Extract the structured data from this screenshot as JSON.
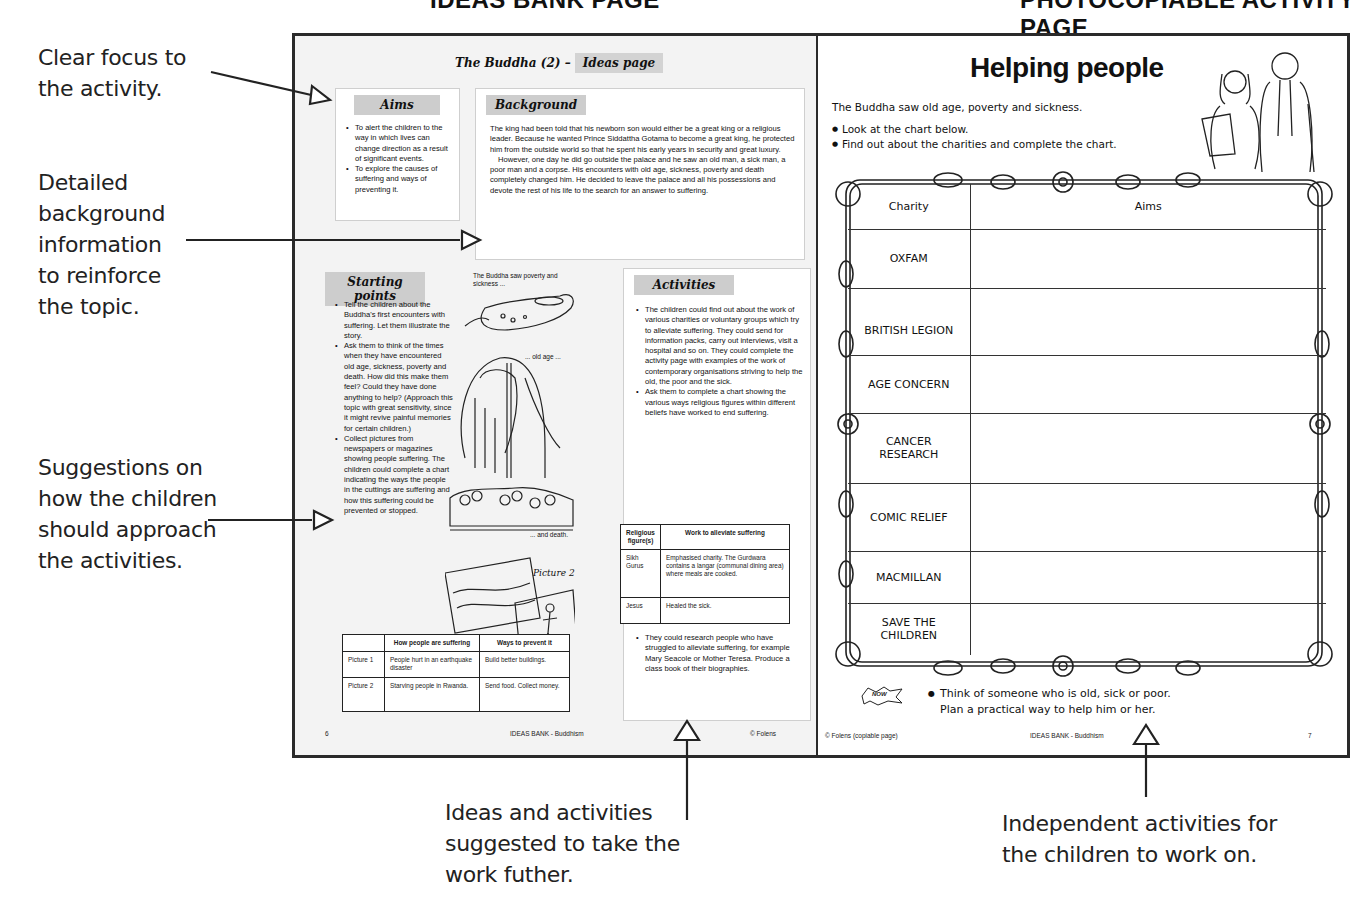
{
  "headings": {
    "left": "IDEAS BANK PAGE",
    "right": "PHOTOCOPIABLE ACTIVITY PAGE"
  },
  "annotations": {
    "clear_focus": [
      "Clear focus to",
      "the activity."
    ],
    "background_info": [
      "Detailed",
      "background",
      "information",
      "to reinforce",
      "the topic."
    ],
    "suggestions": [
      "Suggestions on",
      "how the children",
      "should approach",
      "the activities."
    ],
    "ideas_further": [
      "Ideas and activities",
      "suggested to take the",
      "work futher."
    ],
    "independent": [
      "Independent activities for",
      "the children to work on."
    ]
  },
  "ideas_page": {
    "title": "The Buddha (2) –",
    "title_tag": "Ideas page",
    "aims": {
      "heading": "Aims",
      "items": [
        "To alert the children to the way in which lives can change direction as a result of significant events.",
        "To explore the causes of suffering and ways of preventing it."
      ]
    },
    "background": {
      "heading": "Background",
      "paragraphs": [
        "The king had been told that his newborn son would either be a great king or a religious leader. Because he wanted Prince Siddattha Gotama to become a great king, he protected him from the outside world so that he spent his early years in security and great luxury.",
        "However, one day he did go outside the palace and he saw an old man, a sick man, a poor man and a corpse. His encounters with old age, sickness, poverty and death completely changed him. He decided to leave the palace and all his possessions and devote the rest of his life to the search for an answer to suffering."
      ]
    },
    "starting_points": {
      "heading": "Starting points",
      "items": [
        "Tell the children about the Buddha's first encounters with suffering. Let them illustrate the story.",
        "Ask them to think of the times when they have encountered old age, sickness, poverty and death. How did this make them feel? Could they have done anything to help? (Approach this topic with great sensitivity, since it might revive painful memories for certain children.)",
        "Collect pictures from newspapers or magazines showing people suffering. The children could complete a chart indicating the ways the people in the cuttings are suffering and how this suffering could be prevented or stopped."
      ]
    },
    "illustration_captions": {
      "poverty": "The Buddha saw poverty and sickness ...",
      "old_age": "... old age ...",
      "death": "... and death.",
      "picture1": "Picture 1",
      "picture2": "Picture 2"
    },
    "suffering_table": {
      "headers": [
        "",
        "How people are suffering",
        "Ways to prevent it"
      ],
      "rows": [
        [
          "Picture 1",
          "People hurt in an earthquake disaster",
          "Build better buildings."
        ],
        [
          "Picture 2",
          "Starving people in Rwanda.",
          "Send food. Collect money."
        ]
      ]
    },
    "activities": {
      "heading": "Activities",
      "items": [
        "The children could find out about the work of various charities or voluntary groups which try to alleviate suffering. They could send for information packs, carry out interviews, visit a hospital and so on. They could complete the activity page with examples of the work of contemporary organisations striving to help the old, the poor and the sick.",
        "Ask them to complete a chart showing the various ways religious figures within different beliefs have worked to end suffering."
      ],
      "extra_item": "They could research people who have struggled to alleviate suffering, for example Mary Seacole or Mother Teresa. Produce a class book of their biographies."
    },
    "religious_table": {
      "headers": [
        "Religious figure(s)",
        "Work to alleviate suffering"
      ],
      "rows": [
        [
          "Sikh Gurus",
          "Emphasised charity. The Gurdwara contains a langar (communal dining area) where meals are cooked."
        ],
        [
          "Jesus",
          "Healed the sick."
        ]
      ]
    },
    "footer": {
      "page_number": "6",
      "series": "IDEAS BANK - Buddhism",
      "copyright": "© Folens"
    }
  },
  "activity_page": {
    "title": "Helping people",
    "intro": "The Buddha saw old age, poverty and sickness.",
    "instructions": [
      "Look at the chart below.",
      "Find out about the charities and complete the chart."
    ],
    "chart_headers": [
      "Charity",
      "Aims"
    ],
    "charities": [
      "OXFAM",
      "BRITISH LEGION",
      "AGE CONCERN",
      "CANCER RESEARCH",
      "COMIC RELIEF",
      "MACMILLAN",
      "SAVE THE CHILDREN"
    ],
    "now_badge": "NOW",
    "task": [
      "Think of someone who is old, sick or poor.",
      "Plan a practical way to help him or her."
    ],
    "footer": {
      "copyright": "© Folens (copiable page)",
      "series": "IDEAS BANK - Buddhism",
      "page_number": "7"
    }
  }
}
